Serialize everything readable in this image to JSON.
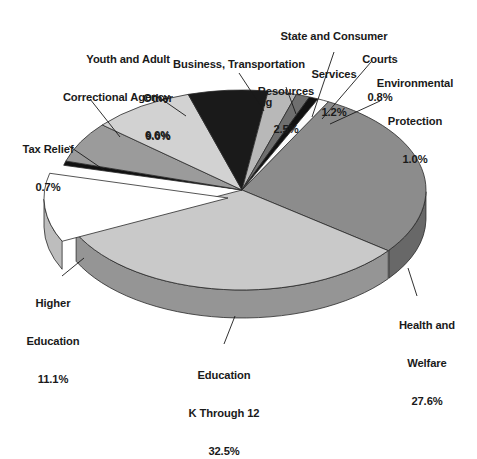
{
  "chart_data": {
    "type": "pie",
    "title": "",
    "subtitle": "",
    "xlabel": "",
    "ylabel": "",
    "legend_position": "labels-with-leader-lines",
    "grid": false,
    "style": "3d-exploded-pie",
    "total_percent": 100.0,
    "categories": [
      "Health and Welfare",
      "Education K Through 12",
      "Higher Education",
      "Tax Relief",
      "Youth and Adult Correctional Agency",
      "Other",
      "Business, Transportation and Housing",
      "Resources",
      "State and Consumer Services",
      "Courts",
      "Environmental Protection"
    ],
    "values": [
      27.6,
      32.5,
      11.1,
      0.7,
      6.6,
      9.0,
      7.0,
      2.5,
      1.2,
      0.8,
      1.0
    ],
    "value_labels": [
      "27.6%",
      "32.5%",
      "11.1%",
      "0.7%",
      "6.6%",
      "9.0%",
      "7.0%",
      "2.5%",
      "1.2%",
      "0.8%",
      "1.0%"
    ],
    "slice_colors": [
      "#8c8c8c",
      "#c9c9c9",
      "#ffffff",
      "#111111",
      "#9b9b9b",
      "#d2d2d2",
      "#1a1a1a",
      "#b8b8b8",
      "#6f6f6f",
      "#111111",
      "#fbfbfb"
    ],
    "slices": [
      {
        "name": "Health and Welfare",
        "percent": 27.6,
        "label": "Health and\nWelfare",
        "percent_label": "27.6%",
        "color": "#8c8c8c"
      },
      {
        "name": "Education K Through 12",
        "percent": 32.5,
        "label": "Education\nK Through 12",
        "percent_label": "32.5%",
        "color": "#c9c9c9"
      },
      {
        "name": "Higher Education",
        "percent": 11.1,
        "label": "Higher\nEducation",
        "percent_label": "11.1%",
        "color": "#ffffff"
      },
      {
        "name": "Tax Relief",
        "percent": 0.7,
        "label": "Tax Relief",
        "percent_label": "0.7%",
        "color": "#111111"
      },
      {
        "name": "Youth and Adult Correctional Agency",
        "percent": 6.6,
        "label": "Youth and Adult\nCorrectional Agency",
        "percent_label": "6.6%",
        "color": "#9b9b9b"
      },
      {
        "name": "Other",
        "percent": 9.0,
        "label": "Other",
        "percent_label": "9.0%",
        "color": "#d2d2d2"
      },
      {
        "name": "Business, Transportation and Housing",
        "percent": 7.0,
        "label": "Business, Transportation\nand Housing",
        "percent_label": "7.0%",
        "color": "#1a1a1a"
      },
      {
        "name": "Resources",
        "percent": 2.5,
        "label": "Resources",
        "percent_label": "2.5%",
        "color": "#b8b8b8"
      },
      {
        "name": "State and Consumer Services",
        "percent": 1.2,
        "label": "State and Consumer\nServices",
        "percent_label": "1.2%",
        "color": "#6f6f6f"
      },
      {
        "name": "Courts",
        "percent": 0.8,
        "label": "Courts",
        "percent_label": "0.8%",
        "color": "#111111"
      },
      {
        "name": "Environmental Protection",
        "percent": 1.0,
        "label": "Environmental\nProtection",
        "percent_label": "1.0%",
        "color": "#fbfbfb"
      }
    ]
  },
  "labels": {
    "health_and_welfare": {
      "line1": "Health and",
      "line2": "Welfare",
      "value": "27.6%"
    },
    "education_k12": {
      "line1": "Education",
      "line2": "K Through 12",
      "value": "32.5%"
    },
    "higher_education": {
      "line1": "Higher",
      "line2": "Education",
      "value": "11.1%"
    },
    "tax_relief": {
      "line1": "Tax Relief",
      "value": "0.7%"
    },
    "youth_correctional": {
      "line1": "Youth and Adult",
      "line2": "Correctional Agency",
      "value": "6.6%"
    },
    "other": {
      "line1": "Other",
      "value": "9.0%"
    },
    "business_transportation": {
      "line1": "Business, Transportation",
      "line2": "and Housing",
      "value": "7.0%"
    },
    "resources": {
      "line1": "Resources",
      "value": "2.5%"
    },
    "state_consumer_services": {
      "line1": "State and Consumer",
      "line2": "Services",
      "value": "1.2%"
    },
    "courts": {
      "line1": "Courts",
      "value": "0.8%"
    },
    "environmental_protection": {
      "line1": "Environmental",
      "line2": "Protection",
      "value": "1.0%"
    }
  }
}
